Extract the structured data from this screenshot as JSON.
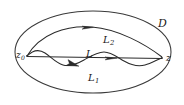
{
  "figure": {
    "type": "mathematical-diagram",
    "background_color": "#ffffff",
    "stroke_color": "#2a2a2a",
    "labels": {
      "domain": "D",
      "start_point": "z",
      "start_point_subscript": "0",
      "end_point": "z",
      "path_upper": "L",
      "path_upper_subscript": "2",
      "path_middle": "L",
      "path_lower": "L",
      "path_lower_subscript": "1"
    },
    "geometry": {
      "domain_ellipse": {
        "cx": 93,
        "cy": 52,
        "rx": 79,
        "ry": 41
      },
      "endpoint_left": {
        "x": 26,
        "y": 56
      },
      "endpoint_right": {
        "x": 163,
        "y": 58
      },
      "arrow_upper": {
        "x": 88,
        "y": 27
      },
      "arrow_lower": {
        "x": 76,
        "y": 64
      },
      "arrow_middle": {
        "x": 114,
        "y": 61
      }
    }
  }
}
